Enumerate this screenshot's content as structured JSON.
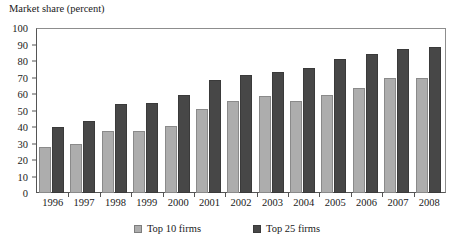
{
  "chart_data": {
    "type": "bar",
    "title": "",
    "ylabel": "Market share (percent)",
    "xlabel": "",
    "ylim": [
      0,
      100
    ],
    "ytick_step": 10,
    "yticks": [
      100,
      90,
      80,
      70,
      60,
      50,
      40,
      30,
      20,
      10,
      0
    ],
    "grid": false,
    "legend_position": "bottom",
    "categories": [
      "1996",
      "1997",
      "1998",
      "1999",
      "2000",
      "2001",
      "2002",
      "2003",
      "2004",
      "2005",
      "2006",
      "2007",
      "2008"
    ],
    "series": [
      {
        "name": "Top 10 firms",
        "color": "#adadad",
        "values": [
          28,
          30,
          38,
          38,
          41,
          51,
          56,
          59,
          56,
          60,
          64,
          70,
          70
        ]
      },
      {
        "name": "Top 25 firms",
        "color": "#474747",
        "values": [
          40,
          44,
          54,
          55,
          60,
          69,
          72,
          74,
          76,
          82,
          85,
          88,
          89
        ]
      }
    ]
  },
  "legend": {
    "items": [
      {
        "label": "Top 10 firms",
        "swatch": "light-gray-square"
      },
      {
        "label": "Top 25 firms",
        "swatch": "dark-gray-square"
      }
    ]
  }
}
